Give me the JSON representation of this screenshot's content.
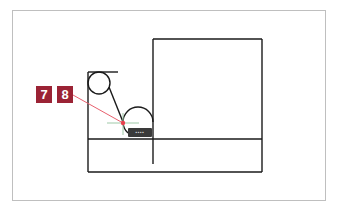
{
  "colors": {
    "accent": "#9b2335",
    "leader_line": "#e8606e",
    "snap_point": "#e8404e",
    "crosshair": "#9fc9a8",
    "drawing": "#1a1a1a",
    "frame": "#bfbfbf",
    "tooltip_bg": "#3a3a3a"
  },
  "callouts": [
    {
      "label": "7"
    },
    {
      "label": "8"
    }
  ],
  "snap_tooltip": {
    "text": "▪▪▪▪"
  }
}
